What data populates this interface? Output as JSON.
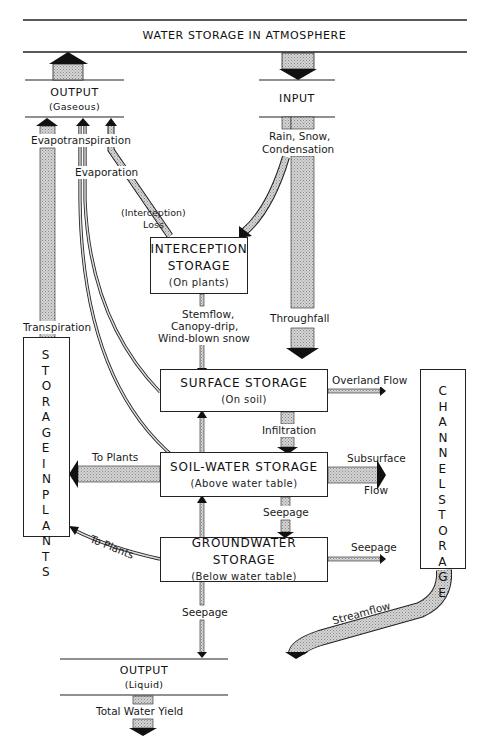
{
  "diagram": {
    "title": "WATER STORAGE IN ATMOSPHERE",
    "output_gaseous": {
      "title": "OUTPUT",
      "subtitle": "(Gaseous)"
    },
    "input": {
      "title": "INPUT"
    },
    "output_liquid": {
      "title": "OUTPUT",
      "subtitle": "(Liquid)"
    },
    "boxes": {
      "interception": {
        "title_line1": "INTERCEPTION",
        "title_line2": "STORAGE",
        "subtitle": "(On plants)"
      },
      "surface": {
        "title": "SURFACE STORAGE",
        "subtitle": "(On soil)"
      },
      "soil_water": {
        "title": "SOIL-WATER STORAGE",
        "subtitle": "(Above water table)"
      },
      "groundwater": {
        "title": "GROUNDWATER STORAGE",
        "subtitle": "(Below water table)"
      },
      "plants": {
        "word1": "STORAGE",
        "word2": "IN",
        "word3": "PLANTS"
      },
      "channel": {
        "word1": "CHANNEL",
        "word2": "STORAGE"
      }
    },
    "flows": {
      "evapotranspiration": "Evapotranspiration",
      "evaporation": "Evaporation",
      "interception_loss_line1": "(Interception)",
      "interception_loss_line2": "Loss",
      "rain_snow_line1": "Rain, Snow,",
      "rain_snow_line2": "Condensation",
      "transpiration": "Transpiration",
      "stemflow_line1": "Stemflow,",
      "stemflow_line2": "Canopy-drip,",
      "stemflow_line3": "Wind-blown snow",
      "throughfall": "Throughfall",
      "overland_flow": "Overland Flow",
      "infiltration": "Infiltration",
      "subsurface_line1": "Subsurface",
      "subsurface_line2": "Flow",
      "to_plants_soil": "To Plants",
      "to_plants_ground": "To Plants",
      "seepage_soil_to_ground": "Seepage",
      "seepage_to_channel": "Seepage",
      "seepage_down": "Seepage",
      "streamflow": "Streamflow",
      "total_water_yield": "Total Water Yield"
    },
    "colors": {
      "line": "#222222",
      "fill_stipple": "#bdbdbd",
      "arrowhead": "#111111",
      "background": "#ffffff"
    }
  }
}
